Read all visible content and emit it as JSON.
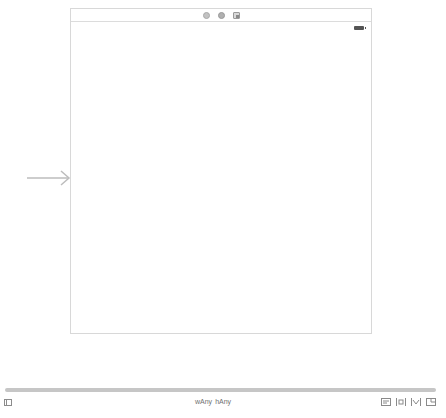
{
  "canvas": {
    "scene": {
      "dock_icons": [
        {
          "name": "view-controller-icon",
          "kind": "vc"
        },
        {
          "name": "first-responder-icon",
          "kind": "responder"
        },
        {
          "name": "exit-icon",
          "kind": "exit"
        }
      ],
      "status_bar": {
        "battery_icon": "battery-icon"
      },
      "background_color": "#ffffff"
    },
    "entry_point": {
      "icon": "arrow-right-icon",
      "color": "#bdbdbd"
    }
  },
  "bottom_bar": {
    "document_outline_icon": "document-outline-icon",
    "size_class": {
      "width_label": "wAny",
      "height_label": "hAny",
      "width_display": " w Any",
      "height_display": "h Any"
    },
    "size_class_text": {
      "width": "wAny",
      "height": "hAny"
    },
    "layout_tools": [
      {
        "name": "align-icon"
      },
      {
        "name": "pin-icon"
      },
      {
        "name": "resolve-autolayout-icon"
      },
      {
        "name": "resizing-behavior-icon"
      }
    ]
  }
}
